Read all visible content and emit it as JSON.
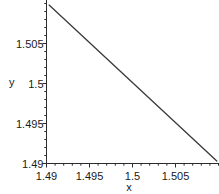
{
  "figure": {
    "background": "#ffffff"
  },
  "chart_data": {
    "type": "line",
    "xlabel": "x",
    "ylabel": "y",
    "xlim": [
      1.49,
      1.51
    ],
    "ylim": [
      1.49,
      1.5104
    ],
    "x_ticks": [
      1.49,
      1.495,
      1.5,
      1.505
    ],
    "x_tick_labels": [
      "1.49",
      "1.495",
      "1.5",
      "1.505"
    ],
    "y_ticks": [
      1.49,
      1.495,
      1.5,
      1.505
    ],
    "y_tick_labels": [
      "1.49",
      "1.495",
      "1.5",
      "1.505"
    ],
    "minor_tick_step": 0.001,
    "grid": false,
    "legend": false,
    "axis_color": "#2b2b2b",
    "tick_label_color": "#1a1a1a",
    "line_color": "#3a3a3a",
    "series": [
      {
        "name": "line",
        "x": [
          1.4903,
          1.5098
        ],
        "y": [
          1.5098,
          1.4903
        ]
      }
    ]
  }
}
